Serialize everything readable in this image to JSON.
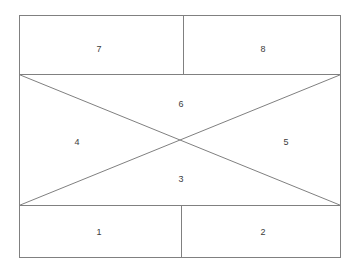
{
  "canvas": {
    "width": 361,
    "height": 271,
    "background": "#ffffff"
  },
  "style": {
    "line_color": "#808080",
    "line_width": 1,
    "label_color": "#3c3c3c",
    "label_font_size": 9
  },
  "diagram": {
    "type": "partitioned-rectangle",
    "outer_rect": {
      "x1": 19,
      "y1": 15,
      "x2": 341,
      "y2": 258
    },
    "horizontal_dividers": [
      {
        "name": "upper-divider",
        "y": 74,
        "x1": 19,
        "x2": 341
      },
      {
        "name": "lower-divider",
        "y": 205,
        "x1": 19,
        "x2": 341
      }
    ],
    "vertical_dividers": [
      {
        "name": "top-row-divider",
        "x": 183,
        "y1": 15,
        "y2": 74
      },
      {
        "name": "bottom-row-divider",
        "x": 181,
        "y1": 205,
        "y2": 258
      }
    ],
    "diagonals": [
      {
        "name": "diagonal-tl-br",
        "x1": 19,
        "y1": 74,
        "x2": 341,
        "y2": 205
      },
      {
        "name": "diagonal-bl-tr",
        "x1": 19,
        "y1": 205,
        "x2": 341,
        "y2": 74
      }
    ],
    "intersection": {
      "x": 180,
      "y": 140
    }
  },
  "regions": [
    {
      "id": "region-7",
      "label": "7",
      "x": 99,
      "y": 49
    },
    {
      "id": "region-8",
      "label": "8",
      "x": 263,
      "y": 49
    },
    {
      "id": "region-6",
      "label": "6",
      "x": 181,
      "y": 104
    },
    {
      "id": "region-4",
      "label": "4",
      "x": 77,
      "y": 142
    },
    {
      "id": "region-5",
      "label": "5",
      "x": 286,
      "y": 142
    },
    {
      "id": "region-3",
      "label": "3",
      "x": 181,
      "y": 179
    },
    {
      "id": "region-1",
      "label": "1",
      "x": 99,
      "y": 232
    },
    {
      "id": "region-2",
      "label": "2",
      "x": 263,
      "y": 232
    }
  ]
}
